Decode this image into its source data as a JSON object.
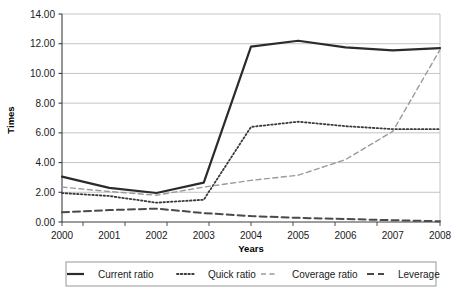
{
  "chart_data": {
    "type": "line",
    "title": "",
    "xlabel": "Years",
    "ylabel": "Times",
    "categories": [
      "2000",
      "2001",
      "2002",
      "2003",
      "2004",
      "2005",
      "2006",
      "2007",
      "2008"
    ],
    "x": [
      2000,
      2001,
      2002,
      2003,
      2004,
      2005,
      2006,
      2007,
      2008
    ],
    "ylim": [
      0,
      14
    ],
    "ytick_values": [
      0,
      2,
      4,
      6,
      8,
      10,
      12,
      14
    ],
    "ytick_labels": [
      "0.00",
      "2.00",
      "4.00",
      "6.00",
      "8.00",
      "10.00",
      "12.00",
      "14.00"
    ],
    "grid": "horizontal",
    "legend_position": "bottom",
    "series": [
      {
        "name": "Current ratio",
        "style": "solid",
        "color": "#2b2b2b",
        "width": 2.2,
        "values": [
          3.05,
          2.3,
          1.95,
          2.65,
          11.8,
          12.2,
          11.75,
          11.55,
          11.7
        ]
      },
      {
        "name": "Quick ratio",
        "style": "dotted",
        "color": "#3a3a3a",
        "width": 1.8,
        "values": [
          1.95,
          1.75,
          1.3,
          1.5,
          6.4,
          6.75,
          6.45,
          6.25,
          6.25
        ]
      },
      {
        "name": "Coverage ratio",
        "style": "dashed-light",
        "color": "#9a9a9a",
        "width": 1.4,
        "values": [
          2.35,
          2.05,
          1.8,
          2.35,
          2.8,
          3.15,
          4.2,
          6.1,
          11.6
        ]
      },
      {
        "name": "Leverage",
        "style": "dashed-dark",
        "color": "#4a4a4a",
        "width": 2.0,
        "values": [
          0.65,
          0.8,
          0.9,
          0.6,
          0.4,
          0.28,
          0.2,
          0.12,
          0.05
        ]
      }
    ]
  },
  "legend": {
    "items": [
      {
        "label": "Current ratio"
      },
      {
        "label": "Quick ratio"
      },
      {
        "label": "Coverage ratio"
      },
      {
        "label": "Leverage"
      }
    ]
  },
  "colors": {
    "axis": "#3d3d3d",
    "grid": "#b5b5b5",
    "text": "#1a1a1a",
    "legend_border": "#8c8c8c",
    "background": "#ffffff"
  }
}
